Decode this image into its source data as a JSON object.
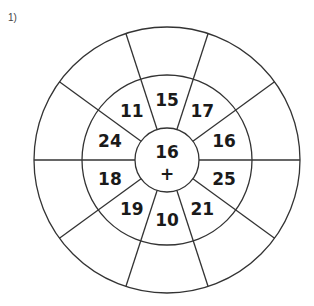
{
  "problem_label": "1)",
  "center": {
    "value": "16",
    "operator": "+"
  },
  "ring_numbers": [
    "15",
    "17",
    "16",
    "25",
    "21",
    "10",
    "19",
    "18",
    "24",
    "11"
  ],
  "colors": {
    "line": "#333333",
    "text": "#1a1a1a",
    "background": "#ffffff"
  }
}
